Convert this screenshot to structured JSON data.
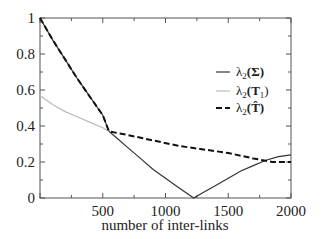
{
  "chart_data": {
    "type": "line",
    "title": "",
    "xlabel": "number of inter-links",
    "ylabel": "",
    "xlim": [
      0,
      2000
    ],
    "ylim": [
      0,
      1
    ],
    "xticks": [
      "500",
      "1000",
      "1500",
      "2000"
    ],
    "yticks": [
      "0",
      "0.2",
      "0.4",
      "0.6",
      "0.8",
      "1"
    ],
    "grid": false,
    "legend_position": "upper right",
    "series": [
      {
        "name": "λ2(Σ)",
        "style": "solid-dark",
        "x": [
          0,
          100,
          200,
          300,
          400,
          500,
          550,
          600,
          700,
          800,
          900,
          1000,
          1100,
          1225,
          1300,
          1400,
          1500,
          1600,
          1700,
          1800,
          1900,
          2000
        ],
        "y": [
          1.0,
          0.88,
          0.77,
          0.66,
          0.56,
          0.46,
          0.37,
          0.34,
          0.28,
          0.22,
          0.16,
          0.11,
          0.06,
          0.0,
          0.03,
          0.07,
          0.11,
          0.15,
          0.18,
          0.21,
          0.23,
          0.24
        ]
      },
      {
        "name": "λ2(T1)",
        "style": "solid-light",
        "x": [
          0,
          100,
          200,
          300,
          400,
          500,
          550
        ],
        "y": [
          0.57,
          0.52,
          0.48,
          0.45,
          0.42,
          0.39,
          0.37
        ]
      },
      {
        "name": "λ2(T̂)",
        "style": "dashed",
        "x": [
          0,
          100,
          200,
          300,
          400,
          500,
          550,
          700,
          900,
          1100,
          1300,
          1500,
          1700,
          1850,
          2000
        ],
        "y": [
          1.0,
          0.88,
          0.77,
          0.66,
          0.56,
          0.46,
          0.37,
          0.35,
          0.32,
          0.29,
          0.27,
          0.25,
          0.22,
          0.2,
          0.2
        ]
      }
    ]
  },
  "legend": {
    "items": [
      {
        "base": "λ",
        "sub": "2",
        "arg": "(Σ)"
      },
      {
        "base": "λ",
        "sub": "2",
        "arg": "(T",
        "argsub": "1",
        "close": ")"
      },
      {
        "base": "λ",
        "sub": "2",
        "arg": "(T̂)"
      }
    ]
  }
}
